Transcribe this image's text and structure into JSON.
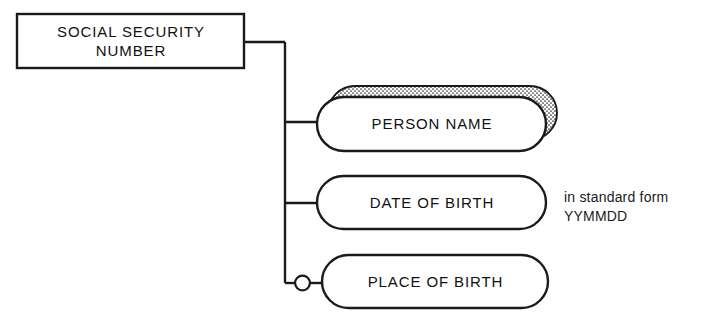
{
  "diagram": {
    "type": "data-structure-diagram",
    "background_color": "#ffffff",
    "line_color": "#1a1a1a",
    "root": {
      "id": "social-security-number",
      "shape": "rectangle",
      "label": "SOCIAL SECURITY\nNUMBER",
      "x": 17,
      "y": 14,
      "width": 227,
      "height": 54
    },
    "attributes": [
      {
        "id": "person-name",
        "shape": "rounded-pill",
        "label": "PERSON NAME",
        "x": 317,
        "y": 97,
        "width": 229,
        "height": 54,
        "repeating": true,
        "optional": false,
        "shadow_fill": "stipple",
        "shadow_offset_x": 11,
        "shadow_offset_y": -11
      },
      {
        "id": "date-of-birth",
        "shape": "rounded-pill",
        "label": "DATE OF BIRTH",
        "x": 317,
        "y": 176,
        "width": 229,
        "height": 53,
        "repeating": false,
        "optional": false
      },
      {
        "id": "place-of-birth",
        "shape": "rounded-pill",
        "label": "PLACE OF BIRTH",
        "x": 322,
        "y": 255,
        "width": 226,
        "height": 53,
        "repeating": false,
        "optional": true,
        "optional_marker": "circle"
      }
    ],
    "connectors": {
      "trunk_x": 285,
      "root_exit_y": 42,
      "branch_y": [
        122,
        203,
        283
      ]
    },
    "annotation": {
      "id": "date-format-note",
      "text": "in standard form\nYYMMDD",
      "x": 564,
      "y": 188
    }
  }
}
